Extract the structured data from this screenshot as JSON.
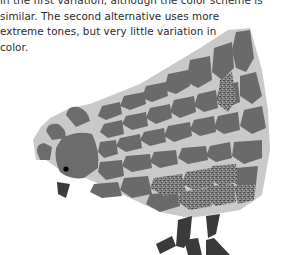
{
  "text": {
    "lines": [
      "in the first variation, although the color scheme is",
      "similar. The second alternative uses more",
      "extreme tones, but very little variation in",
      "color."
    ]
  },
  "illustration": {
    "subject": "mosaic-chicken",
    "colors": {
      "grout": "#c8c8c8",
      "tile": "#6b6b6b",
      "tile_dark": "#3a3a3a",
      "speckled": "#7a7a7a",
      "eye": "#000000"
    }
  }
}
